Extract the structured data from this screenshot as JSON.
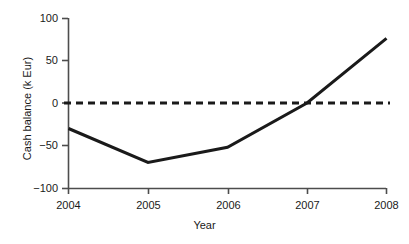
{
  "chart_data": {
    "type": "line",
    "title": "",
    "subtitle": "",
    "xlabel": "Year",
    "ylabel": "Cash balance (k Eur)",
    "x": [
      2004,
      2005,
      2006,
      2007,
      2008
    ],
    "categories": [
      "2004",
      "2005",
      "2006",
      "2007",
      "2008"
    ],
    "series": [
      {
        "name": "Cash balance",
        "values": [
          -30,
          -70,
          -52,
          0,
          76
        ],
        "style": "solid",
        "color": "#1a1a1a",
        "width": 3
      },
      {
        "name": "Break-even",
        "values": [
          0,
          0,
          0,
          0,
          0
        ],
        "style": "dashed",
        "color": "#1a1a1a",
        "width": 3
      }
    ],
    "xlim": [
      2004,
      2008
    ],
    "ylim": [
      -100,
      100
    ],
    "yticks": [
      100,
      50,
      0,
      -50,
      -100
    ],
    "ytick_labels": [
      "100",
      "50",
      "0",
      "−50",
      "−100"
    ],
    "xticks": [
      2004,
      2005,
      2006,
      2007,
      2008
    ],
    "xtick_labels": [
      "2004",
      "2005",
      "2006",
      "2007",
      "2008"
    ],
    "grid": false,
    "legend": "none",
    "annotations": []
  },
  "axes": {
    "y_title": "Cash balance (k Eur)",
    "x_title": "Year",
    "y_labels": {
      "t100": "100",
      "t50": "50",
      "t0": "0",
      "tm50": "−50",
      "tm100": "−100"
    },
    "x_labels": {
      "y2004": "2004",
      "y2005": "2005",
      "y2006": "2006",
      "y2007": "2007",
      "y2008": "2008"
    }
  },
  "colors": {
    "axis": "#4d4d4d",
    "line": "#1a1a1a",
    "text": "#1a1a1a",
    "background": "#ffffff"
  }
}
